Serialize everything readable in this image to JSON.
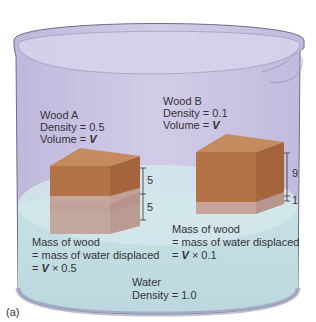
{
  "figure": {
    "panel_label": "(a)",
    "colors": {
      "beaker_glass": "#cbc3e4",
      "beaker_rim": "#d6d0ea",
      "beaker_outline": "#6f6c88",
      "water": "#c3dde2",
      "water_surface": "#d6e9ec",
      "wood_top": "#c4875a",
      "wood_front": "#b47247",
      "wood_side": "#9f5f3a",
      "wood_submerged": "#c9aba3",
      "text": "#333338"
    }
  },
  "wood_a": {
    "title": "Wood A",
    "density": "Density = 0.5",
    "volume_prefix": "Volume = ",
    "volume_var": "V",
    "above_water": "5",
    "below_water": "5",
    "mass_line1": "Mass of wood",
    "mass_line2": "= mass of water displaced",
    "mass_line3_prefix": "= ",
    "mass_line3_var": "V",
    "mass_line3_suffix": " × 0.5"
  },
  "wood_b": {
    "title": "Wood B",
    "density": "Density = 0.1",
    "volume_prefix": "Volume = ",
    "volume_var": "V",
    "above_water": "9",
    "below_water": "1",
    "mass_line1": "Mass of wood",
    "mass_line2": "= mass of water displaced",
    "mass_line3_prefix": "= ",
    "mass_line3_var": "V",
    "mass_line3_suffix": " × 0.1"
  },
  "water": {
    "title": "Water",
    "density": "Density = 1.0"
  }
}
